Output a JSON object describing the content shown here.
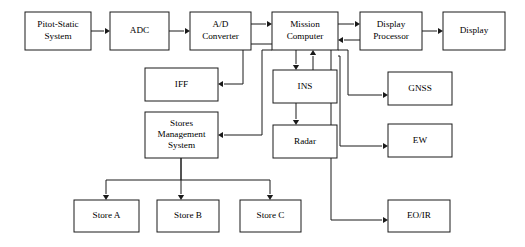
{
  "diagram": {
    "type": "block-diagram",
    "background_color": "#ffffff",
    "line_color": "#1a1a1a",
    "box_fill_color": "#ffffff",
    "text_color": "#000000",
    "canvas": {
      "width": 525,
      "height": 247
    },
    "nodes": [
      {
        "id": "pitot-static-system",
        "lines": [
          "Pitot-Static",
          "System"
        ],
        "x": 25,
        "y": 12,
        "w": 66,
        "h": 38
      },
      {
        "id": "adc",
        "lines": [
          "ADC"
        ],
        "x": 110,
        "y": 12,
        "w": 59,
        "h": 38
      },
      {
        "id": "ad-converter",
        "lines": [
          "A/D",
          "Converter"
        ],
        "x": 190,
        "y": 12,
        "w": 61,
        "h": 38
      },
      {
        "id": "mission-computer",
        "lines": [
          "Mission",
          "Computer"
        ],
        "x": 272,
        "y": 12,
        "w": 66,
        "h": 38
      },
      {
        "id": "display-processor",
        "lines": [
          "Display",
          "Processor"
        ],
        "x": 360,
        "y": 12,
        "w": 62,
        "h": 38
      },
      {
        "id": "display",
        "lines": [
          "Display"
        ],
        "x": 443,
        "y": 12,
        "w": 62,
        "h": 38
      },
      {
        "id": "iff",
        "lines": [
          "IFF"
        ],
        "x": 145,
        "y": 68,
        "w": 73,
        "h": 33
      },
      {
        "id": "ins",
        "lines": [
          "INS"
        ],
        "x": 273,
        "y": 70,
        "w": 64,
        "h": 33
      },
      {
        "id": "gnss",
        "lines": [
          "GNSS"
        ],
        "x": 388,
        "y": 72,
        "w": 64,
        "h": 33
      },
      {
        "id": "stores-management-system",
        "lines": [
          "Stores",
          "Management",
          "System"
        ],
        "x": 145,
        "y": 112,
        "w": 73,
        "h": 46
      },
      {
        "id": "radar",
        "lines": [
          "Radar"
        ],
        "x": 273,
        "y": 125,
        "w": 64,
        "h": 33
      },
      {
        "id": "ew",
        "lines": [
          "EW"
        ],
        "x": 388,
        "y": 124,
        "w": 64,
        "h": 33
      },
      {
        "id": "store-a",
        "lines": [
          "Store A"
        ],
        "x": 74,
        "y": 200,
        "w": 65,
        "h": 32
      },
      {
        "id": "store-b",
        "lines": [
          "Store B"
        ],
        "x": 157,
        "y": 200,
        "w": 62,
        "h": 32
      },
      {
        "id": "store-c",
        "lines": [
          "Store C"
        ],
        "x": 240,
        "y": 200,
        "w": 61,
        "h": 32
      },
      {
        "id": "eo-ir",
        "lines": [
          "EO/IR"
        ],
        "x": 388,
        "y": 200,
        "w": 62,
        "h": 32
      }
    ],
    "connections": [
      {
        "id": "pitot-to-adc",
        "from": "pitot-static-system",
        "to": "adc",
        "d": "M 91 31 L 104 31",
        "arrow": {
          "x": 110,
          "y": 31,
          "dir": "right"
        }
      },
      {
        "id": "adc-to-ad-converter",
        "from": "adc",
        "to": "ad-converter",
        "d": "M 169 31 L 184 31",
        "arrow": {
          "x": 190,
          "y": 31,
          "dir": "right"
        }
      },
      {
        "id": "ad-converter-to-mission-computer",
        "from": "ad-converter",
        "to": "mission-computer",
        "d": "M 251 24 L 266 24",
        "arrow": {
          "x": 272,
          "y": 24,
          "dir": "right"
        }
      },
      {
        "id": "mission-computer-to-display-processor",
        "from": "mission-computer",
        "to": "display-processor",
        "d": "M 338 24 L 354 24",
        "arrow": {
          "x": 360,
          "y": 24,
          "dir": "right"
        }
      },
      {
        "id": "display-processor-to-mission-computer",
        "from": "display-processor",
        "to": "mission-computer",
        "d": "M 360 40 L 344 40",
        "arrow": {
          "x": 338,
          "y": 40,
          "dir": "left"
        }
      },
      {
        "id": "display-processor-to-display",
        "from": "display-processor",
        "to": "display",
        "d": "M 422 31 L 437 31",
        "arrow": {
          "x": 443,
          "y": 31,
          "dir": "right"
        }
      },
      {
        "id": "mission-computer-to-ins",
        "from": "mission-computer",
        "to": "ins",
        "d": "M 296 50 L 296 64",
        "arrow": {
          "x": 296,
          "y": 70,
          "dir": "down"
        }
      },
      {
        "id": "ins-to-mission-computer",
        "from": "ins",
        "to": "mission-computer",
        "d": "M 313 70 L 313 56",
        "arrow": {
          "x": 313,
          "y": 50,
          "dir": "up"
        }
      },
      {
        "id": "ins-to-radar",
        "from": "ins",
        "to": "radar",
        "d": "M 296 103 L 296 119",
        "arrow": {
          "x": 296,
          "y": 125,
          "dir": "down"
        }
      },
      {
        "id": "mission-computer-to-iff",
        "from": "mission-computer",
        "to": "iff",
        "d": "M 272 44 L 243 44 L 243 84 L 224 84",
        "arrow": {
          "x": 218,
          "y": 84,
          "dir": "left"
        }
      },
      {
        "id": "mission-computer-to-stores",
        "from": "mission-computer",
        "to": "stores-management-system",
        "d": "M 272 50 L 262 50 L 262 135 L 224 135",
        "arrow": {
          "x": 218,
          "y": 135,
          "dir": "left"
        }
      },
      {
        "id": "mission-computer-to-gnss",
        "from": "mission-computer",
        "to": "gnss",
        "d": "M 338 50 L 348 50 L 348 95 L 382 95",
        "arrow": {
          "x": 388,
          "y": 95,
          "dir": "right"
        }
      },
      {
        "id": "mission-computer-to-ew",
        "from": "mission-computer",
        "to": "ew",
        "d": "M 338 56 L 340 56 L 340 146 L 382 146",
        "arrow": {
          "x": 388,
          "y": 146,
          "dir": "right"
        }
      },
      {
        "id": "mission-computer-to-eo-ir",
        "from": "mission-computer",
        "to": "eo-ir",
        "d": "M 331 50 L 331 220 L 382 220",
        "arrow": {
          "x": 388,
          "y": 220,
          "dir": "right"
        }
      },
      {
        "id": "stores-to-store-a",
        "from": "stores-management-system",
        "to": "store-a",
        "d": "M 181 158 L 181 180 L 106 180 L 106 194",
        "arrow": {
          "x": 106,
          "y": 200,
          "dir": "down"
        }
      },
      {
        "id": "stores-to-store-b",
        "from": "stores-management-system",
        "to": "store-b",
        "d": "M 181 158 L 181 194",
        "arrow": {
          "x": 181,
          "y": 200,
          "dir": "down"
        }
      },
      {
        "id": "stores-to-store-c",
        "from": "stores-management-system",
        "to": "store-c",
        "d": "M 181 180 L 270 180 L 270 194",
        "arrow": {
          "x": 270,
          "y": 200,
          "dir": "down"
        }
      }
    ]
  }
}
